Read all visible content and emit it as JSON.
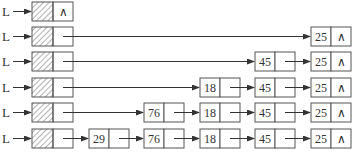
{
  "diagram": {
    "head_label": "L",
    "null_symbol": "∧",
    "rows": [
      {
        "label": "L",
        "nodes": []
      },
      {
        "label": "L",
        "nodes": [
          "25"
        ]
      },
      {
        "label": "L",
        "nodes": [
          "45",
          "25"
        ]
      },
      {
        "label": "L",
        "nodes": [
          "18",
          "45",
          "25"
        ]
      },
      {
        "label": "L",
        "nodes": [
          "76",
          "18",
          "45",
          "25"
        ]
      },
      {
        "label": "L",
        "nodes": [
          "29",
          "76",
          "18",
          "45",
          "25"
        ]
      }
    ]
  },
  "colors": {
    "line": "#555555",
    "text": "#333333",
    "hatch": "#666666"
  }
}
